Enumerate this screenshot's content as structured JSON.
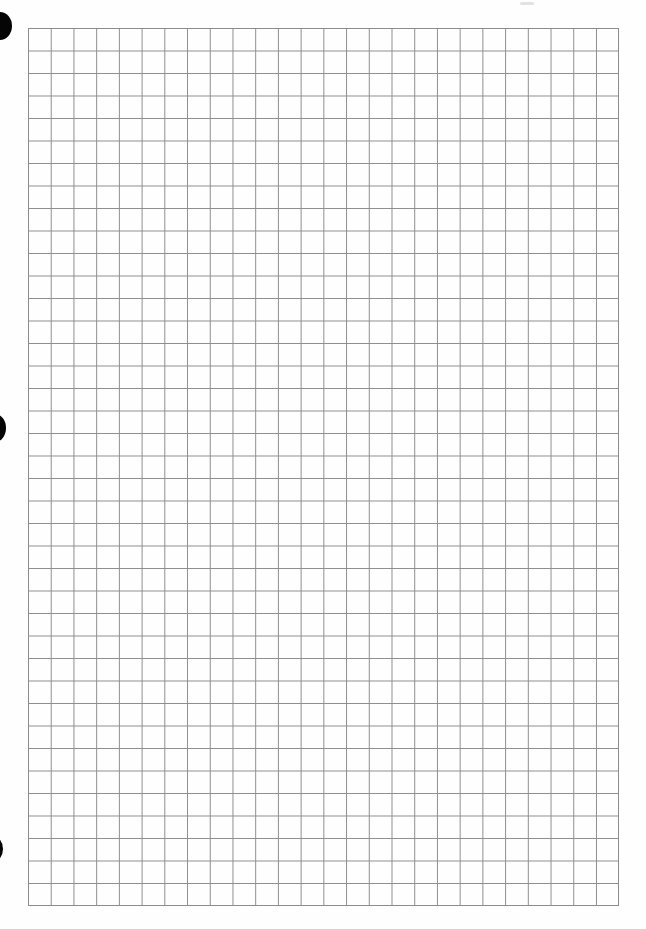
{
  "document": {
    "type": "graph-paper",
    "grid": {
      "columns": 26,
      "rows": 39,
      "line_color": "#8e8e8e",
      "background_color": "#fefefe"
    },
    "binder_holes": [
      {
        "position": "top"
      },
      {
        "position": "middle"
      },
      {
        "position": "bottom"
      }
    ]
  }
}
